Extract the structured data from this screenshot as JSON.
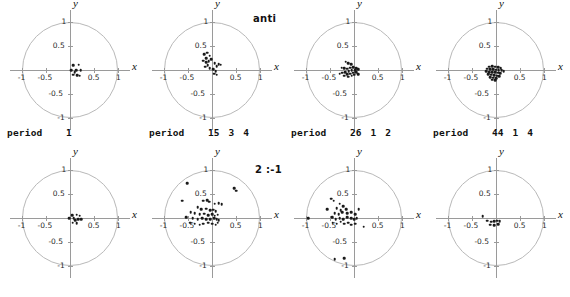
{
  "figure": {
    "width": 570,
    "height": 297,
    "background": "#ffffff",
    "point_color": "#1a1a1a",
    "circle_color": "#b9b9b9",
    "axis_color": "#9a9a9a"
  },
  "labels": {
    "anti": "anti",
    "ratio": "2 :-1",
    "period_word": "period"
  },
  "axes": {
    "x_name": "x",
    "y_name": "y",
    "x_ticks": [
      "-1",
      "-0.5",
      "0.5",
      "1"
    ],
    "x_tick_values": [
      -1,
      -0.5,
      0.5,
      1
    ],
    "y_ticks": [
      "1",
      "0.5",
      "-0.5",
      "-1"
    ],
    "y_tick_values": [
      1,
      0.5,
      -0.5,
      -1
    ],
    "xlim": [
      -1.25,
      1.25
    ],
    "ylim": [
      -1.25,
      1.25
    ]
  },
  "chart_data": {
    "type": "scatter",
    "title": "",
    "xlabel": "x",
    "ylabel": "y",
    "xlim": [
      -1.25,
      1.25
    ],
    "ylim": [
      -1.25,
      1.25
    ],
    "grid": false,
    "legend": "none",
    "annotations": [
      "anti",
      "2 :-1"
    ],
    "unit_circle": true,
    "panels": [
      {
        "row": "anti",
        "index": 0,
        "period_label": "period",
        "period_values": [
          "1"
        ],
        "points": [
          [
            0.07,
            0.1
          ],
          [
            0.18,
            0.11
          ],
          [
            0.02,
            0.0
          ],
          [
            0.13,
            0.0
          ],
          [
            0.22,
            -0.01
          ],
          [
            0.07,
            -0.1
          ],
          [
            0.15,
            -0.11
          ],
          [
            0.2,
            -0.12
          ],
          [
            0.1,
            -0.05
          ]
        ]
      },
      {
        "row": "anti",
        "index": 1,
        "period_label": "period",
        "period_values": [
          "15",
          "3",
          "4"
        ],
        "points": [
          [
            -0.16,
            0.33
          ],
          [
            -0.1,
            0.36
          ],
          [
            -0.05,
            0.3
          ],
          [
            -0.12,
            0.24
          ],
          [
            -0.18,
            0.19
          ],
          [
            -0.12,
            0.16
          ],
          [
            -0.07,
            0.18
          ],
          [
            -0.02,
            0.22
          ],
          [
            0.06,
            0.14
          ],
          [
            0.14,
            0.12
          ],
          [
            0.18,
            0.11
          ],
          [
            0.1,
            0.08
          ],
          [
            -0.09,
            0.1
          ],
          [
            -0.14,
            0.07
          ],
          [
            -0.05,
            0.04
          ],
          [
            0.02,
            0.02
          ],
          [
            0.08,
            -0.02
          ],
          [
            0.05,
            -0.08
          ],
          [
            0.1,
            -0.1
          ]
        ]
      },
      {
        "row": "anti",
        "index": 2,
        "period_label": "period",
        "period_values": [
          "26",
          "1",
          "2"
        ],
        "points": [
          [
            -0.17,
            0.17
          ],
          [
            -0.12,
            0.14
          ],
          [
            -0.06,
            0.12
          ],
          [
            -0.26,
            0.05
          ],
          [
            -0.2,
            0.04
          ],
          [
            -0.14,
            0.03
          ],
          [
            -0.08,
            0.05
          ],
          [
            -0.02,
            0.06
          ],
          [
            0.04,
            0.04
          ],
          [
            0.09,
            0.02
          ],
          [
            0.02,
            0.0
          ],
          [
            -0.05,
            -0.01
          ],
          [
            -0.11,
            -0.02
          ],
          [
            -0.18,
            -0.04
          ],
          [
            -0.24,
            -0.06
          ],
          [
            -0.3,
            -0.08
          ],
          [
            -0.14,
            -0.09
          ],
          [
            -0.08,
            -0.08
          ],
          [
            -0.02,
            -0.06
          ],
          [
            0.05,
            -0.05
          ],
          [
            0.09,
            -0.09
          ],
          [
            -0.2,
            -0.12
          ],
          [
            -0.12,
            -0.14
          ],
          [
            -0.05,
            -0.12
          ],
          [
            0.0,
            -0.1
          ]
        ]
      },
      {
        "row": "anti",
        "index": 3,
        "period_label": "period",
        "period_values": [
          "44",
          "1",
          "4"
        ],
        "points": [
          [
            -0.14,
            0.07
          ],
          [
            -0.08,
            0.08
          ],
          [
            -0.02,
            0.07
          ],
          [
            0.04,
            0.06
          ],
          [
            0.1,
            0.04
          ],
          [
            -0.18,
            0.03
          ],
          [
            -0.12,
            0.02
          ],
          [
            -0.06,
            0.02
          ],
          [
            0.0,
            0.01
          ],
          [
            0.06,
            0.0
          ],
          [
            0.12,
            -0.01
          ],
          [
            0.16,
            -0.03
          ],
          [
            -0.2,
            -0.03
          ],
          [
            -0.14,
            -0.04
          ],
          [
            -0.08,
            -0.05
          ],
          [
            -0.02,
            -0.05
          ],
          [
            0.04,
            -0.06
          ],
          [
            0.09,
            -0.07
          ],
          [
            -0.16,
            -0.09
          ],
          [
            -0.1,
            -0.1
          ],
          [
            -0.04,
            -0.11
          ],
          [
            0.02,
            -0.12
          ],
          [
            0.07,
            -0.13
          ],
          [
            -0.12,
            -0.15
          ],
          [
            -0.06,
            -0.16
          ],
          [
            0.0,
            -0.17
          ],
          [
            -0.08,
            -0.2
          ],
          [
            -0.02,
            -0.21
          ]
        ]
      },
      {
        "row": "2:-1",
        "index": 0,
        "period_label": "",
        "period_values": [],
        "points": [
          [
            0.05,
            0.06
          ],
          [
            0.14,
            0.07
          ],
          [
            0.2,
            0.05
          ],
          [
            -0.02,
            0.0
          ],
          [
            0.08,
            -0.01
          ],
          [
            0.17,
            -0.02
          ],
          [
            0.23,
            -0.03
          ],
          [
            0.06,
            -0.1
          ],
          [
            0.14,
            -0.11
          ],
          [
            0.11,
            -0.05
          ]
        ]
      },
      {
        "row": "2:-1",
        "index": 1,
        "period_label": "",
        "period_values": [],
        "points": [
          [
            -0.52,
            0.72
          ],
          [
            0.46,
            0.62
          ],
          [
            0.5,
            0.57
          ],
          [
            -0.62,
            0.36
          ],
          [
            -0.18,
            0.36
          ],
          [
            -0.1,
            0.37
          ],
          [
            -0.06,
            0.34
          ],
          [
            0.06,
            0.3
          ],
          [
            0.14,
            0.31
          ],
          [
            0.2,
            0.29
          ],
          [
            -0.3,
            0.22
          ],
          [
            -0.22,
            0.18
          ],
          [
            -0.12,
            0.19
          ],
          [
            -0.04,
            0.16
          ],
          [
            0.02,
            0.17
          ],
          [
            0.08,
            0.14
          ],
          [
            -0.44,
            0.12
          ],
          [
            -0.36,
            0.1
          ],
          [
            -0.26,
            0.08
          ],
          [
            -0.16,
            0.09
          ],
          [
            -0.08,
            0.06
          ],
          [
            0.0,
            0.08
          ],
          [
            0.06,
            0.05
          ],
          [
            0.12,
            0.07
          ],
          [
            -0.54,
            0.02
          ],
          [
            -0.4,
            0.0
          ],
          [
            -0.3,
            -0.02
          ],
          [
            -0.2,
            0.0
          ],
          [
            -0.12,
            -0.03
          ],
          [
            -0.04,
            -0.02
          ],
          [
            0.04,
            -0.01
          ],
          [
            0.1,
            -0.03
          ],
          [
            0.14,
            -0.05
          ],
          [
            -0.46,
            -0.1
          ],
          [
            -0.36,
            -0.12
          ],
          [
            -0.26,
            -0.14
          ],
          [
            -0.18,
            -0.12
          ],
          [
            -0.08,
            -0.1
          ],
          [
            0.0,
            -0.12
          ],
          [
            0.08,
            -0.14
          ],
          [
            0.12,
            -0.1
          ]
        ]
      },
      {
        "row": "2:-1",
        "index": 2,
        "period_label": "",
        "period_values": [],
        "points": [
          [
            -0.48,
            0.4
          ],
          [
            -0.42,
            0.36
          ],
          [
            -0.3,
            0.3
          ],
          [
            -0.22,
            0.24
          ],
          [
            -0.56,
            0.18
          ],
          [
            -0.36,
            0.2
          ],
          [
            -0.28,
            0.16
          ],
          [
            -0.16,
            0.18
          ],
          [
            0.1,
            0.18
          ],
          [
            -0.4,
            0.1
          ],
          [
            -0.32,
            0.08
          ],
          [
            -0.24,
            0.12
          ],
          [
            -0.14,
            0.1
          ],
          [
            -0.06,
            0.12
          ],
          [
            0.02,
            0.08
          ],
          [
            -0.96,
            0.0
          ],
          [
            -0.46,
            0.02
          ],
          [
            -0.38,
            -0.02
          ],
          [
            -0.3,
            0.0
          ],
          [
            -0.22,
            -0.02
          ],
          [
            -0.14,
            0.02
          ],
          [
            -0.06,
            0.0
          ],
          [
            0.0,
            -0.02
          ],
          [
            0.06,
            0.0
          ],
          [
            -0.44,
            -0.1
          ],
          [
            -0.36,
            -0.12
          ],
          [
            -0.28,
            -0.08
          ],
          [
            -0.2,
            -0.12
          ],
          [
            -0.12,
            -0.1
          ],
          [
            -0.06,
            -0.14
          ],
          [
            0.02,
            -0.12
          ],
          [
            0.2,
            -0.18
          ],
          [
            -0.4,
            -0.86
          ],
          [
            -0.2,
            -0.84
          ]
        ]
      },
      {
        "row": "2:-1",
        "index": 3,
        "period_label": "",
        "period_values": [],
        "points": [
          [
            -0.28,
            0.04
          ],
          [
            -0.18,
            -0.06
          ],
          [
            -0.1,
            -0.08
          ],
          [
            -0.04,
            -0.07
          ],
          [
            0.02,
            -0.06
          ],
          [
            0.08,
            -0.07
          ],
          [
            -0.12,
            -0.14
          ],
          [
            -0.04,
            -0.15
          ],
          [
            0.04,
            -0.13
          ]
        ]
      }
    ]
  }
}
